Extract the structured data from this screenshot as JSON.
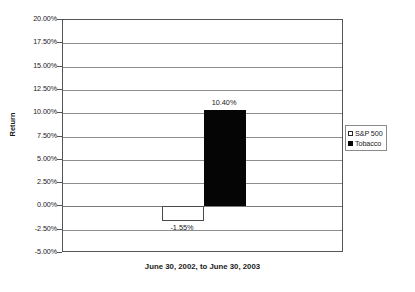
{
  "chart_data": {
    "type": "bar",
    "title": "",
    "subtitle": "",
    "xlabel": "June 30, 2002, to June 30, 2003",
    "ylabel": "Return",
    "categories": [
      "June 30, 2002, to June 30, 2003"
    ],
    "series": [
      {
        "name": "S&P 500",
        "values": [
          -1.55
        ],
        "value_labels": [
          "-1.55%"
        ],
        "swatch": "hollow",
        "color": "#ffffff",
        "border_color": "#4a4a4a"
      },
      {
        "name": "Tobacco",
        "values": [
          10.4
        ],
        "value_labels": [
          "10.40%"
        ],
        "swatch": "filled",
        "color": "#050505",
        "border_color": "#050505"
      }
    ],
    "ylim": [
      -5.0,
      20.0
    ],
    "ytick_values": [
      20.0,
      17.5,
      15.0,
      12.5,
      10.0,
      7.5,
      5.0,
      2.5,
      0.0,
      -2.5,
      -5.0
    ],
    "ytick_labels": [
      "20.00%",
      "17.50%",
      "15.00%",
      "12.50%",
      "10.00%",
      "7.50%",
      "5.00%",
      "2.50%",
      "0.00%",
      "-2.50%",
      "-5.00%"
    ],
    "grid": true,
    "grid_axis": "y",
    "legend_position": "right",
    "zero_line": 0.0,
    "background_color": "#ffffff",
    "grid_color": "#8d8d8d",
    "axis_color": "#555555"
  },
  "legend": {
    "entries": [
      {
        "label": "S&P 500"
      },
      {
        "label": "Tobacco"
      }
    ]
  },
  "axes": {
    "y_title": "Return",
    "x_title": "June 30, 2002, to June 30, 2003"
  }
}
